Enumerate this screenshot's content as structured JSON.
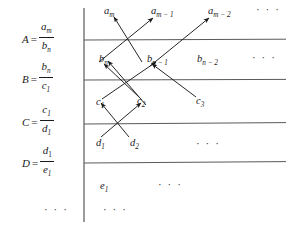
{
  "figure": {
    "ink_color": "#1a1a1a",
    "rule_color": "#555555",
    "background": "#ffffff",
    "divider_x": 84,
    "row_rules_y": [
      40,
      80,
      124,
      163
    ]
  },
  "left_labels": [
    {
      "name": "A",
      "equals": "=",
      "numerator": "a",
      "numerator_sub": "m",
      "denominator": "b",
      "denominator_sub": "n",
      "y": 22
    },
    {
      "name": "B",
      "equals": "=",
      "numerator": "b",
      "numerator_sub": "n",
      "denominator": "c",
      "denominator_sub": "1",
      "y": 62
    },
    {
      "name": "C",
      "equals": "=",
      "numerator": "c",
      "numerator_sub": "1",
      "denominator": "d",
      "denominator_sub": "1",
      "y": 105
    },
    {
      "name": "D",
      "equals": "=",
      "numerator": "d",
      "numerator_sub": "1",
      "denominator": "e",
      "denominator_sub": "1",
      "y": 146
    }
  ],
  "left_dots": "· · ·",
  "rows": [
    {
      "row": "a",
      "terms": [
        {
          "base": "a",
          "sub": "m",
          "x": 104,
          "y": 5
        },
        {
          "base": "a",
          "sub": "m − 1",
          "x": 155,
          "y": 5
        },
        {
          "base": "a",
          "sub": "m − 2",
          "x": 212,
          "y": 5
        }
      ],
      "trailing_dots": "· · ·",
      "dots_x": 256,
      "dots_y": 6
    },
    {
      "row": "b",
      "terms": [
        {
          "base": "b",
          "sub": "n",
          "x": 103,
          "y": 53
        },
        {
          "base": "b",
          "sub": "n − 1",
          "x": 150,
          "y": 53
        },
        {
          "base": "b",
          "sub": "n − 2",
          "x": 200,
          "y": 53
        }
      ],
      "trailing_dots": "· · ·",
      "dots_x": 253,
      "dots_y": 54
    },
    {
      "row": "c",
      "terms": [
        {
          "base": "c",
          "sub": "1",
          "x": 100,
          "y": 96
        },
        {
          "base": "c",
          "sub": "2",
          "x": 140,
          "y": 96
        },
        {
          "base": "c",
          "sub": "3",
          "x": 197,
          "y": 96
        }
      ],
      "trailing_dots": "",
      "dots_x": 0,
      "dots_y": 0
    },
    {
      "row": "d",
      "terms": [
        {
          "base": "d",
          "sub": "1",
          "x": 100,
          "y": 138
        },
        {
          "base": "d",
          "sub": "2",
          "x": 133,
          "y": 138
        }
      ],
      "trailing_dots": "· · ·",
      "dots_x": 196,
      "dots_y": 140
    },
    {
      "row": "e",
      "terms": [
        {
          "base": "e",
          "sub": "1",
          "x": 103,
          "y": 181
        }
      ],
      "trailing_dots": "· · ·",
      "dots_x": 160,
      "dots_y": 182
    }
  ],
  "bottom_dots": {
    "left": "· · ·",
    "left_x": 44,
    "right": "· · ·",
    "right_x": 103,
    "y": 209
  },
  "arrows": [
    {
      "id": "bn-to-am",
      "from": "b_n",
      "to": "a_m",
      "x1": 142,
      "y1": 62,
      "x2": 114,
      "y2": 17
    },
    {
      "id": "bn1-to-am",
      "from": "b_n-1",
      "to": "a_m-1",
      "x1": 99,
      "y1": 62,
      "x2": 155,
      "y2": 17
    },
    {
      "id": "bn2-to-am2",
      "from": "b_n-2",
      "to": "a_m-2",
      "x1": 150,
      "y1": 66,
      "x2": 211,
      "y2": 17
    },
    {
      "id": "c1-to-bn",
      "from": "c_1",
      "to": "b_n",
      "x1": 145,
      "y1": 104,
      "x2": 107,
      "y2": 61
    },
    {
      "id": "c2-to-bn",
      "from": "c_2",
      "to": "b_n",
      "x1": 137,
      "y1": 95,
      "x2": 104,
      "y2": 62
    },
    {
      "id": "c1-to-bn1",
      "from": "c_1",
      "to": "b_n-1",
      "x1": 104,
      "y1": 98,
      "x2": 157,
      "y2": 62
    },
    {
      "id": "c3-to-bn2",
      "from": "c_3",
      "to": "b_n-2",
      "x1": 196,
      "y1": 97,
      "x2": 151,
      "y2": 64
    },
    {
      "id": "d1-to-c1",
      "from": "d_1",
      "to": "c_1",
      "x1": 128,
      "y1": 137,
      "x2": 102,
      "y2": 104
    },
    {
      "id": "d2-to-c2",
      "from": "d_2",
      "to": "c_2",
      "x1": 101,
      "y1": 137,
      "x2": 142,
      "y2": 103
    },
    {
      "id": "bn-lower-in",
      "from": "c-band",
      "to": "b_n",
      "x1": 139,
      "y1": 89,
      "x2": 105,
      "y2": 66
    }
  ]
}
